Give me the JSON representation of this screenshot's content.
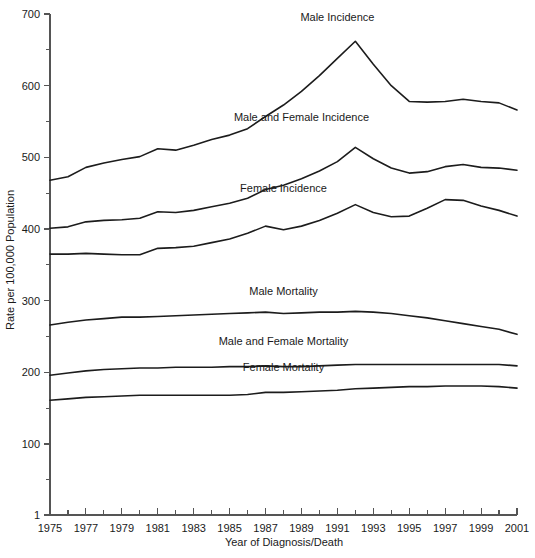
{
  "chart_data": {
    "type": "line",
    "title": "",
    "xlabel": "Year of Diagnosis/Death",
    "ylabel": "Rate per 100,000 Population",
    "xlim": [
      1975,
      2001
    ],
    "ylim": [
      1,
      700
    ],
    "grid": false,
    "legend_position": "inline-annotations",
    "x_tick_labels": [
      "1975",
      "1977",
      "1979",
      "1981",
      "1983",
      "1985",
      "1987",
      "1989",
      "1991",
      "1993",
      "1995",
      "1997",
      "1999",
      "2001"
    ],
    "x_tick_values": [
      1975,
      1977,
      1979,
      1981,
      1983,
      1985,
      1987,
      1989,
      1991,
      1993,
      1995,
      1997,
      1999,
      2001
    ],
    "x_minor_tick_values": [
      1976,
      1978,
      1980,
      1982,
      1984,
      1986,
      1988,
      1990,
      1992,
      1994,
      1996,
      1998,
      2000
    ],
    "y_tick_labels": [
      "1",
      "100",
      "200",
      "300",
      "400",
      "500",
      "600",
      "700"
    ],
    "y_tick_values": [
      1,
      100,
      200,
      300,
      400,
      500,
      600,
      700
    ],
    "y_minor_tick_values": [
      50,
      150,
      250,
      350,
      450,
      550,
      650
    ],
    "x": [
      1975,
      1976,
      1977,
      1978,
      1979,
      1980,
      1981,
      1982,
      1983,
      1984,
      1985,
      1986,
      1987,
      1988,
      1989,
      1990,
      1991,
      1992,
      1993,
      1994,
      1995,
      1996,
      1997,
      1998,
      1999,
      2000,
      2001
    ],
    "series": [
      {
        "name": "Male Incidence",
        "label_x": 1991,
        "label_y": 690,
        "values": [
          468,
          473,
          486,
          492,
          497,
          501,
          512,
          510,
          517,
          525,
          531,
          540,
          557,
          573,
          592,
          614,
          638,
          662,
          630,
          600,
          578,
          577,
          578,
          581,
          578,
          576,
          566
        ]
      },
      {
        "name": "Male and Female Incidence",
        "label_x": 1989,
        "label_y": 551,
        "values": [
          401,
          403,
          410,
          412,
          413,
          415,
          424,
          423,
          426,
          431,
          436,
          443,
          455,
          461,
          470,
          481,
          494,
          514,
          498,
          485,
          478,
          480,
          487,
          490,
          486,
          485,
          482
        ]
      },
      {
        "name": "Female Incidence",
        "label_x": 1988,
        "label_y": 451,
        "values": [
          365,
          365,
          366,
          365,
          364,
          364,
          373,
          374,
          376,
          381,
          386,
          394,
          404,
          399,
          404,
          412,
          422,
          434,
          423,
          417,
          418,
          429,
          441,
          440,
          432,
          426,
          418
        ]
      },
      {
        "name": "Male Mortality",
        "label_x": 1988,
        "label_y": 308,
        "values": [
          266,
          270,
          273,
          275,
          277,
          277,
          278,
          279,
          280,
          281,
          282,
          283,
          284,
          282,
          283,
          284,
          284,
          285,
          284,
          282,
          279,
          276,
          272,
          268,
          264,
          260,
          253
        ]
      },
      {
        "name": "Male and Female Mortality",
        "label_x": 1988,
        "label_y": 238,
        "values": [
          196,
          199,
          202,
          204,
          205,
          206,
          206,
          207,
          207,
          207,
          208,
          208,
          209,
          208,
          208,
          209,
          210,
          211,
          211,
          211,
          211,
          211,
          211,
          211,
          211,
          211,
          209
        ]
      },
      {
        "name": "Female Mortality",
        "label_x": 1988,
        "label_y": 202,
        "values": [
          161,
          163,
          165,
          166,
          167,
          168,
          168,
          168,
          168,
          168,
          168,
          169,
          172,
          172,
          173,
          174,
          175,
          177,
          178,
          179,
          180,
          180,
          181,
          181,
          181,
          180,
          178
        ]
      }
    ]
  }
}
